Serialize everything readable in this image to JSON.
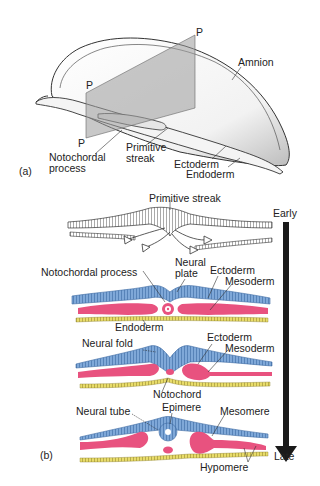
{
  "panel_a": {
    "tag": "(a)",
    "plane_labels": [
      "P",
      "P",
      "P"
    ],
    "labels": {
      "amnion": "Amnion",
      "notochordal_process_line1": "Notochordal",
      "notochordal_process_line2": "process",
      "primitive_streak_line1": "Primitive",
      "primitive_streak_line2": "streak",
      "ectoderm": "Ectoderm",
      "endoderm": "Endoderm"
    }
  },
  "panel_b": {
    "tag": "(b)",
    "timeline": {
      "start": "Early",
      "end": "Late"
    },
    "stage1": {
      "primitive_streak": "Primitive streak"
    },
    "stage2": {
      "notochordal_process": "Notochordal process",
      "neural_plate_line1": "Neural",
      "neural_plate_line2": "plate",
      "ectoderm": "Ectoderm",
      "mesoderm": "Mesoderm",
      "endoderm": "Endoderm"
    },
    "stage3": {
      "neural_fold": "Neural fold",
      "ectoderm": "Ectoderm",
      "mesoderm": "Mesoderm",
      "notochord": "Notochord"
    },
    "stage4": {
      "neural_tube": "Neural tube",
      "epimere": "Epimere",
      "mesomere": "Mesomere",
      "hypomere": "Hypomere"
    }
  },
  "colors": {
    "ectoderm": "#7fa8d8",
    "mesoderm": "#e8527f",
    "endoderm": "#e8dc6a",
    "arrow": "#1a1a1a",
    "plane": "#9a9a9a"
  }
}
